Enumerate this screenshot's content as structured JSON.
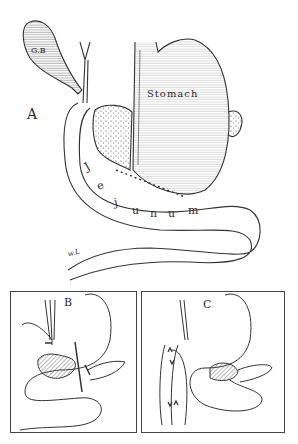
{
  "figure": {
    "main": {
      "panel_label": "A",
      "labels": {
        "gallbladder": "G.B",
        "stomach": "Stomach",
        "jejunum_letters": [
          "J",
          "e",
          "j",
          "u",
          "n",
          "u",
          "m"
        ],
        "signature": "w.L"
      }
    },
    "inset_b": {
      "panel_label": "B"
    },
    "inset_c": {
      "panel_label": "C"
    }
  },
  "colors": {
    "ink": "#2a2a2a",
    "background": "#ffffff"
  }
}
